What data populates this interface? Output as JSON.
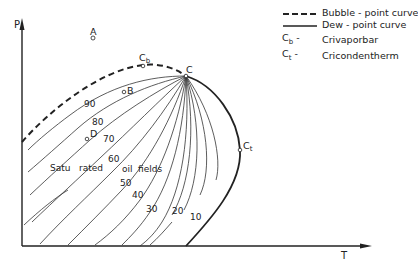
{
  "diagram": {
    "type": "phase-envelope",
    "axes": {
      "y_label": "P",
      "x_label": "T"
    },
    "points": [
      {
        "id": "A",
        "label": "A"
      },
      {
        "id": "B",
        "label": "B"
      },
      {
        "id": "C",
        "label": "C"
      },
      {
        "id": "D",
        "label": "D"
      },
      {
        "id": "Cb",
        "label": "C",
        "sub": "b"
      },
      {
        "id": "Ct",
        "label": "C",
        "sub": "t"
      }
    ],
    "quality_lines": [
      "90",
      "80",
      "70",
      "60",
      "50",
      "40",
      "30",
      "20",
      "10"
    ],
    "region_label": {
      "part1": "Satu",
      "part2": "rated",
      "part3": "oil",
      "part4": "fields"
    }
  },
  "legend": {
    "items": [
      {
        "key": "dashed-line",
        "label": "Bubble - point curve"
      },
      {
        "key": "solid-line",
        "label": "Dew - point curve"
      },
      {
        "key": "C",
        "sub": "b",
        "label": "Crivaporbar"
      },
      {
        "key": "C",
        "sub": "t",
        "label": "Cricondentherm"
      }
    ],
    "dash_sep": "-"
  },
  "colors": {
    "ink": "#222222",
    "background": "#ffffff"
  }
}
